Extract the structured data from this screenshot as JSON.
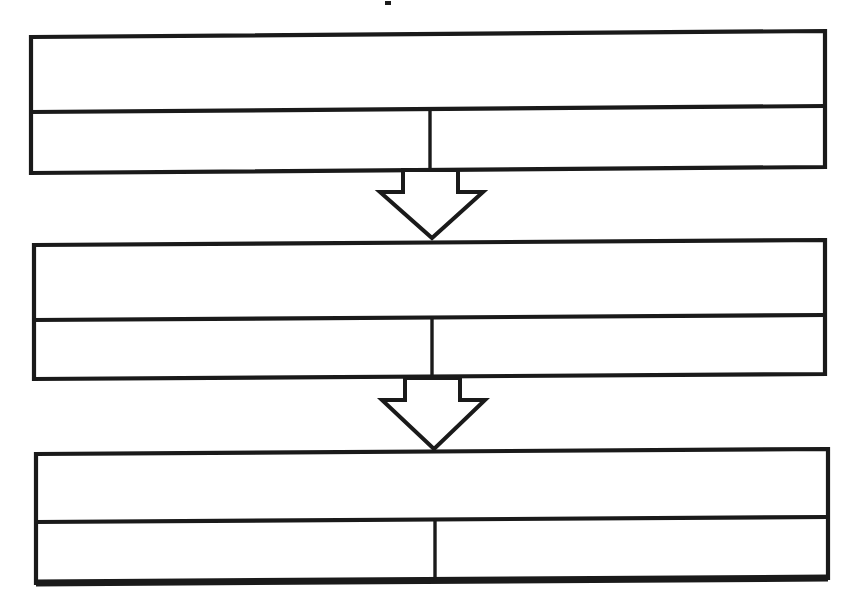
{
  "document": {
    "kind": "flow-diagram",
    "title": "",
    "background_color": "#ffffff",
    "ink_color": "#1a1a1a",
    "width": 860,
    "height": 613,
    "appearance": "scanned line art, slight downward skew on horizontal rules, all cells blank"
  },
  "diagram": {
    "orientation": "vertical",
    "stage_count": 3,
    "connector_count": 2,
    "connector_type": "hollow-block-arrow-down",
    "stages": [
      {
        "id": "stage-1",
        "name": "stage-box-1",
        "header_text": "",
        "cells": [
          {
            "id": "stage-1-cell-left",
            "text": ""
          },
          {
            "id": "stage-1-cell-right",
            "text": ""
          }
        ],
        "geometry": {
          "x": 30,
          "y": 36,
          "width": 795,
          "height": 136,
          "row_divider_y": 110,
          "column_split_x": 430,
          "skew_right_dy": -6
        }
      },
      {
        "id": "stage-2",
        "name": "stage-box-2",
        "header_text": "",
        "cells": [
          {
            "id": "stage-2-cell-left",
            "text": ""
          },
          {
            "id": "stage-2-cell-right",
            "text": ""
          }
        ],
        "geometry": {
          "x": 33,
          "y": 243,
          "width": 792,
          "height": 135,
          "row_divider_y": 318,
          "column_split_x": 432,
          "skew_right_dy": -5
        }
      },
      {
        "id": "stage-3",
        "name": "stage-box-3",
        "header_text": "",
        "cells": [
          {
            "id": "stage-3-cell-left",
            "text": ""
          },
          {
            "id": "stage-3-cell-right",
            "text": ""
          }
        ],
        "geometry": {
          "x": 35,
          "y": 452,
          "width": 793,
          "height": 128,
          "row_divider_y": 520,
          "column_split_x": 435,
          "skew_right_dy": -5,
          "base_is_heavy": true
        }
      }
    ],
    "connectors": [
      {
        "id": "connector-1",
        "name": "arrow-stage-1-to-stage-2",
        "label": "",
        "from": "stage-1",
        "to": "stage-2",
        "geometry": {
          "shaft_left_x": 403,
          "shaft_right_x": 458,
          "top_y": 170,
          "shoulder_y": 192,
          "wing_left_x": 380,
          "wing_right_x": 483,
          "tip_x": 432,
          "tip_y": 238
        }
      },
      {
        "id": "connector-2",
        "name": "arrow-stage-2-to-stage-3",
        "label": "",
        "from": "stage-2",
        "to": "stage-3",
        "geometry": {
          "shaft_left_x": 405,
          "shaft_right_x": 460,
          "top_y": 378,
          "shoulder_y": 400,
          "wing_left_x": 382,
          "wing_right_x": 485,
          "tip_x": 434,
          "tip_y": 449
        }
      }
    ],
    "artifacts": [
      {
        "id": "cropped-title-speck",
        "name": "cropped-title-remnant",
        "description": "",
        "x": 385,
        "y": 1,
        "width": 6,
        "height": 4
      }
    ]
  }
}
